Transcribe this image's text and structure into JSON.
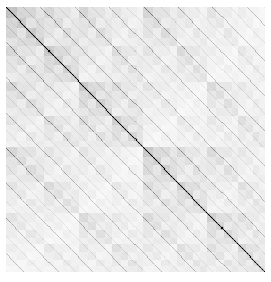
{
  "figure": {
    "title": "",
    "width": 271,
    "height": 282,
    "background": "#ffffff"
  },
  "plot_area": {
    "x": 6,
    "y": 7,
    "width": 259,
    "height": 265,
    "frame_visible": false
  },
  "chart_data": {
    "type": "heatmap",
    "title": "",
    "subtitle": "",
    "xlabel": "",
    "ylabel": "",
    "grid": false,
    "legend": null,
    "colormap": {
      "name": "greys",
      "low_color": "#ffffff",
      "high_color": "#000000",
      "vmin": 0,
      "vmax": 1
    },
    "matrix_size": 256,
    "structure": {
      "type": "recursive-quadrant-kronecker",
      "depth": 5,
      "split_ratio": 0.527,
      "quadrant_weights": [
        [
          0.62,
          0.22
        ],
        [
          0.22,
          0.44
        ]
      ],
      "quadrant_labels": [
        [
          "upper-left",
          "upper-right"
        ],
        [
          "lower-left",
          "lower-right"
        ]
      ]
    },
    "diagonal_bands": {
      "direction": "anti-diagonal-down-right",
      "levels": [
        {
          "period": 34,
          "intensity": 0.42,
          "thickness": 1.0,
          "dot_period": 6
        },
        {
          "period": 17,
          "intensity": 0.17,
          "thickness": 1.0,
          "dot_period": 4
        },
        {
          "period": 8.5,
          "intensity": 0.07,
          "thickness": 1.0,
          "dot_period": 3
        }
      ],
      "main_diagonal_intensity": 0.55
    },
    "texture": {
      "type": "fine-dither",
      "amplitude": 0.1,
      "cell_period": 2
    },
    "axes": {
      "xlim": [
        0,
        256
      ],
      "ylim": [
        256,
        0
      ],
      "xticks": [],
      "yticks": [],
      "xticklabels": [],
      "yticklabels": [],
      "tick_marks_visible": false,
      "spines_visible": false
    }
  }
}
